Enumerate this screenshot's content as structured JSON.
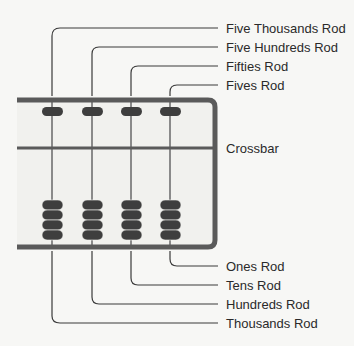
{
  "labels_top": [
    {
      "text": "Five Thousands Rod",
      "y": 21
    },
    {
      "text": "Five Hundreds Rod",
      "y": 40
    },
    {
      "text": "Fifties Rod",
      "y": 59
    },
    {
      "text": "Fives Rod",
      "y": 78
    }
  ],
  "label_crossbar": {
    "text": "Crossbar",
    "y": 141
  },
  "labels_bottom": [
    {
      "text": "Ones Rod",
      "y": 259
    },
    {
      "text": "Tens Rod",
      "y": 278
    },
    {
      "text": "Hundreds Rod",
      "y": 297
    },
    {
      "text": "Thousands Rod",
      "y": 316
    }
  ],
  "colors": {
    "frame": "#5a5a5a",
    "bead": "#3e3e3e",
    "rod": "#8a8a8a",
    "line": "#3a3a3a",
    "inside": "#f1f1ee"
  }
}
